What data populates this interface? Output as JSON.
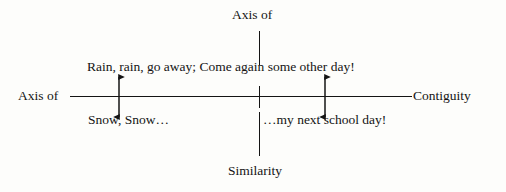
{
  "diagram": {
    "background_color": "#fdfdfb",
    "stroke_color": "#141414",
    "horizontal_axis": {
      "left_label": "Axis of",
      "right_label": "Contiguity"
    },
    "vertical_axis": {
      "top_label": "Axis of",
      "bottom_label": "Similarity"
    },
    "sentence_above": "Rain, rain, go away; Come again some other day!",
    "substitution_left": "Snow, Snow…",
    "substitution_right": "…my next school day!",
    "arrows": [
      {
        "name": "left-substitution-arrow",
        "direction": "double-vertical"
      },
      {
        "name": "right-substitution-arrow",
        "direction": "double-vertical"
      }
    ]
  }
}
